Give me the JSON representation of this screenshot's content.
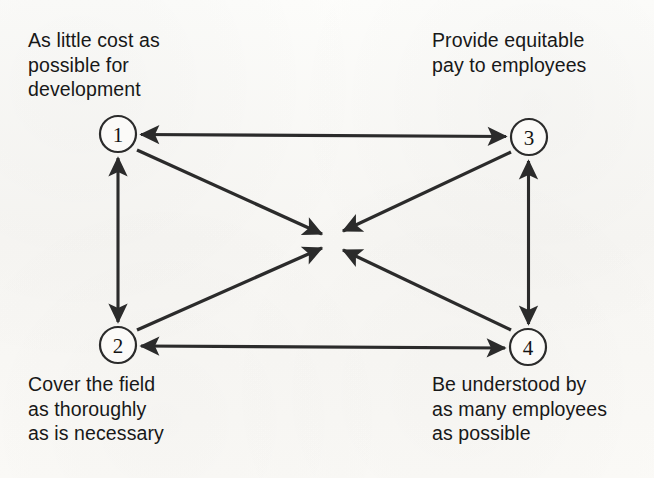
{
  "diagram": {
    "type": "objective-relationship-diagram",
    "background_color": "#fbfaf8",
    "line_color": "#2b2b2b",
    "nodes": [
      {
        "id": "1",
        "label": "1",
        "x": 118,
        "y": 134,
        "r": 18,
        "caption": "As little cost as\npossible for\ndevelopment"
      },
      {
        "id": "3",
        "label": "3",
        "x": 529,
        "y": 137,
        "r": 18,
        "caption": "Provide equitable\npay to employees"
      },
      {
        "id": "2",
        "label": "2",
        "x": 118,
        "y": 345,
        "r": 18,
        "caption": "Cover the field\nas thoroughly\nas is necessary"
      },
      {
        "id": "4",
        "label": "4",
        "x": 528,
        "y": 347,
        "r": 18,
        "caption": "Be understood by\nas many employees\nas possible"
      }
    ],
    "center_point": {
      "x": 332,
      "y": 240
    },
    "edges": [
      {
        "name": "edge-1-3",
        "from": "1",
        "to": "3",
        "style": "double-arrow",
        "orientation": "horizontal-top"
      },
      {
        "name": "edge-2-4",
        "from": "2",
        "to": "4",
        "style": "double-arrow",
        "orientation": "horizontal-bottom"
      },
      {
        "name": "edge-1-2",
        "from": "1",
        "to": "2",
        "style": "double-arrow",
        "orientation": "vertical-left"
      },
      {
        "name": "edge-3-4",
        "from": "3",
        "to": "4",
        "style": "double-arrow",
        "orientation": "vertical-right"
      },
      {
        "name": "edge-1-center",
        "from": "1",
        "to": "center",
        "style": "single-arrow",
        "orientation": "diagonal"
      },
      {
        "name": "edge-3-center",
        "from": "3",
        "to": "center",
        "style": "single-arrow",
        "orientation": "diagonal"
      },
      {
        "name": "edge-2-center",
        "from": "2",
        "to": "center",
        "style": "single-arrow",
        "orientation": "diagonal"
      },
      {
        "name": "edge-4-center",
        "from": "4",
        "to": "center",
        "style": "single-arrow",
        "orientation": "diagonal"
      }
    ]
  }
}
